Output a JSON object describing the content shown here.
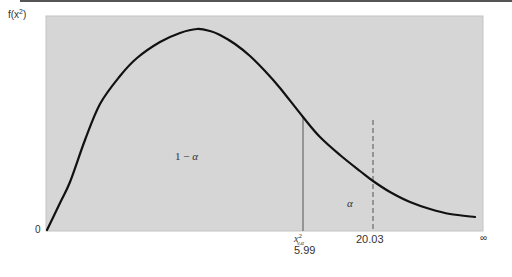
{
  "chart_data": {
    "type": "line",
    "title": "",
    "ylabel": "f(x²)",
    "ylabel_base": "f(x",
    "ylabel_sup": "2",
    "ylabel_close": ")",
    "xlabel": "",
    "x_origin_label": "0",
    "x_end_label": "∞",
    "critical_value": {
      "symbol_base": "x",
      "symbol_sup": "2",
      "symbol_sub": "v,α",
      "value": 5.99,
      "label": "5.99",
      "line_style": "solid"
    },
    "observed_statistic": {
      "value": 20.03,
      "label": "20.03",
      "line_style": "dashed"
    },
    "regions": [
      {
        "name": "acceptance",
        "label": "1 − α",
        "label_num": "1 − ",
        "label_greek": "α"
      },
      {
        "name": "rejection",
        "label": "α"
      }
    ],
    "curve_points_px": [
      [
        47,
        230
      ],
      [
        60,
        203
      ],
      [
        70,
        182
      ],
      [
        85,
        140
      ],
      [
        100,
        104
      ],
      [
        120,
        76
      ],
      [
        137,
        58
      ],
      [
        160,
        42
      ],
      [
        180,
        33
      ],
      [
        197,
        29
      ],
      [
        210,
        31
      ],
      [
        220,
        35
      ],
      [
        235,
        44
      ],
      [
        250,
        56
      ],
      [
        265,
        71
      ],
      [
        280,
        88
      ],
      [
        303,
        117
      ],
      [
        320,
        137
      ],
      [
        340,
        155
      ],
      [
        360,
        171
      ],
      [
        373,
        181
      ],
      [
        390,
        192
      ],
      [
        410,
        202
      ],
      [
        430,
        209
      ],
      [
        450,
        214
      ],
      [
        475,
        217
      ]
    ],
    "grid": false,
    "legend": null
  },
  "colors": {
    "plot_background": "#d6d6d6",
    "curve": "#111111",
    "lines": "#555555",
    "text": "#333333"
  }
}
